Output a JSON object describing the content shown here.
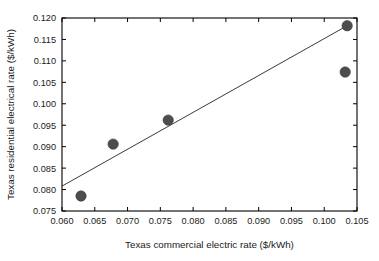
{
  "chart_data": {
    "type": "scatter",
    "title": "",
    "subtitle": "",
    "xlabel": "Texas commercial electric rate ($/kWh)",
    "ylabel": "Texas residential electrical rate ($/kWh)",
    "xlim": [
      0.06,
      0.105
    ],
    "ylim": [
      0.075,
      0.12
    ],
    "grid": false,
    "legend": null,
    "xticks": [
      0.06,
      0.065,
      0.07,
      0.075,
      0.08,
      0.085,
      0.09,
      0.095,
      0.1,
      0.105
    ],
    "yticks": [
      0.075,
      0.08,
      0.085,
      0.09,
      0.095,
      0.1,
      0.105,
      0.11,
      0.115,
      0.12
    ],
    "xticklabels": [
      "0.060",
      "0.065",
      "0.070",
      "0.075",
      "0.080",
      "0.085",
      "0.090",
      "0.095",
      "0.100",
      "0.105"
    ],
    "yticklabels": [
      "0.075",
      "0.080",
      "0.085",
      "0.090",
      "0.095",
      "0.100",
      "0.105",
      "0.110",
      "0.115",
      "0.120"
    ],
    "points": [
      {
        "x": 0.0629,
        "y": 0.0785
      },
      {
        "x": 0.0678,
        "y": 0.0906
      },
      {
        "x": 0.0762,
        "y": 0.0962
      },
      {
        "x": 0.1032,
        "y": 0.1074
      },
      {
        "x": 0.1035,
        "y": 0.1182
      }
    ],
    "marker": {
      "shape": "circle",
      "size_px": 5.2,
      "color": "#4d4d4d"
    },
    "trendline": {
      "type": "linear",
      "x_start": 0.06,
      "y_start": 0.0808,
      "x_end": 0.1035,
      "y_end": 0.1182,
      "color": "#222222"
    },
    "colors": {
      "background": "#ffffff",
      "axis": "#000000",
      "marker": "#4d4d4d",
      "trendline": "#222222",
      "text": "#1a1a1a"
    }
  }
}
